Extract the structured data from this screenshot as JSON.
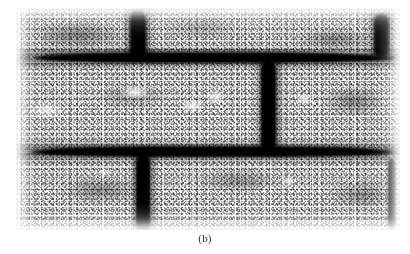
{
  "figure": {
    "caption": "(b)",
    "plate": {
      "left_px": 16,
      "top_px": 8,
      "width_px": 384,
      "height_px": 222,
      "rendering": "coarse-halftone-grayscale-photograph",
      "ink_color": "#000000",
      "paper_color": "#ffffff",
      "midtone_color": "#8a8a8a"
    },
    "courses": [
      {
        "name": "top-course",
        "top_pct": 0,
        "height_pct": 21,
        "description": "partial brick course, cropped at top edge, mottled dark speckle"
      },
      {
        "name": "middle-course",
        "top_pct": 25,
        "height_pct": 38,
        "description": "full brick course with bright voids on left brick and dark mottled right brick"
      },
      {
        "name": "bottom-course",
        "top_pct": 67,
        "height_pct": 33,
        "description": "brick course, cropped at bottom edge, heavy dark grain"
      }
    ],
    "bed_joints": [
      {
        "name": "upper-bed-joint",
        "y_pct": 20.5,
        "thickness_px": 10
      },
      {
        "name": "lower-bed-joint",
        "y_pct": 63.5,
        "thickness_px": 10
      }
    ],
    "head_joints": [
      {
        "name": "top-course-head-joint-left",
        "x_pct": 31,
        "y_pct": 1,
        "height_pct": 21,
        "width_px": 15
      },
      {
        "name": "top-course-head-joint-right",
        "x_pct": 94,
        "y_pct": 2,
        "height_pct": 20,
        "width_px": 14
      },
      {
        "name": "middle-course-head-joint",
        "x_pct": 65,
        "y_pct": 24,
        "height_pct": 40,
        "width_px": 14
      },
      {
        "name": "bottom-course-head-joint",
        "x_pct": 32,
        "y_pct": 66,
        "height_pct": 36,
        "width_px": 13
      },
      {
        "name": "bottom-course-right-edge-joint",
        "x_pct": 97,
        "y_pct": 68,
        "height_pct": 32,
        "width_px": 8
      }
    ]
  }
}
